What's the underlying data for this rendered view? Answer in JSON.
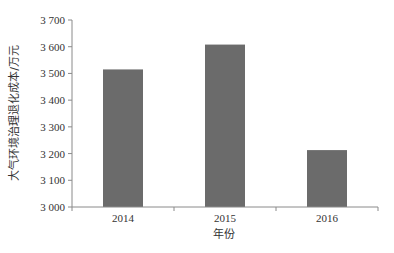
{
  "chart_data": {
    "type": "bar",
    "title": "",
    "xlabel": "年份",
    "ylabel": "大气环境治理退化成本/万元",
    "categories": [
      "2014",
      "2015",
      "2016"
    ],
    "values": [
      3515,
      3608,
      3213
    ],
    "ylim": [
      3000,
      3700
    ],
    "yticks": [
      3000,
      3100,
      3200,
      3300,
      3400,
      3500,
      3600,
      3700
    ],
    "ytick_labels": [
      "3 000",
      "3 100",
      "3 200",
      "3 300",
      "3 400",
      "3 500",
      "3 600",
      "3 700"
    ],
    "grid": false,
    "legend": null,
    "bar_color": "#6b6b6b",
    "axis_color": "#8a8a8a"
  }
}
